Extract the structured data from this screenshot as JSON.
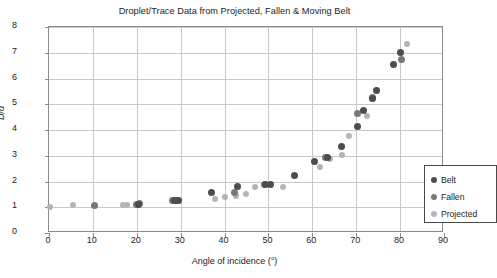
{
  "chart_data": {
    "type": "scatter",
    "title": "Droplet/Trace Data from Projected, Fallen & Moving Belt",
    "xlabel": "Angle of incidence (°)",
    "ylabel": "D/d",
    "xlim": [
      0,
      90
    ],
    "ylim": [
      0,
      8
    ],
    "xticks": [
      0,
      10,
      20,
      30,
      40,
      50,
      60,
      70,
      80,
      90
    ],
    "yticks": [
      0,
      1,
      2,
      3,
      4,
      5,
      6,
      7,
      8
    ],
    "grid": true,
    "legend_position": "right-inside",
    "colors": {
      "belt": "#4d4d4d",
      "fallen": "#787878",
      "projected": "#b4b4b4"
    },
    "series": [
      {
        "name": "Belt",
        "color": "#4d4d4d",
        "points": [
          [
            20.4,
            1.12
          ],
          [
            28.6,
            1.25
          ],
          [
            29.6,
            1.26
          ],
          [
            37.0,
            1.58
          ],
          [
            43.0,
            1.8
          ],
          [
            49.4,
            1.88
          ],
          [
            50.4,
            1.88
          ],
          [
            56.0,
            2.25
          ],
          [
            60.6,
            2.76
          ],
          [
            63.4,
            2.95
          ],
          [
            66.6,
            3.35
          ],
          [
            70.2,
            4.15
          ],
          [
            71.6,
            4.75
          ],
          [
            73.8,
            5.23
          ],
          [
            74.6,
            5.54
          ],
          [
            78.4,
            6.55
          ],
          [
            80.2,
            7.02
          ]
        ]
      },
      {
        "name": "Fallen",
        "color": "#787878",
        "points": [
          [
            10.4,
            1.08
          ],
          [
            20.0,
            1.1
          ],
          [
            20.6,
            1.16
          ],
          [
            28.2,
            1.25
          ],
          [
            29.2,
            1.27
          ],
          [
            42.2,
            1.57
          ],
          [
            49.0,
            1.88
          ],
          [
            63.0,
            2.92
          ],
          [
            70.2,
            4.64
          ],
          [
            73.6,
            5.28
          ],
          [
            80.4,
            6.72
          ]
        ]
      },
      {
        "name": "Projected",
        "color": "#b4b4b4",
        "points": [
          [
            0.2,
            1.02
          ],
          [
            5.4,
            1.1
          ],
          [
            16.8,
            1.08
          ],
          [
            17.8,
            1.08
          ],
          [
            20.0,
            1.08
          ],
          [
            37.8,
            1.32
          ],
          [
            40.2,
            1.4
          ],
          [
            42.6,
            1.45
          ],
          [
            44.8,
            1.52
          ],
          [
            47.0,
            1.78
          ],
          [
            53.4,
            1.8
          ],
          [
            61.8,
            2.58
          ],
          [
            64.0,
            2.86
          ],
          [
            66.8,
            3.04
          ],
          [
            68.4,
            3.76
          ],
          [
            72.4,
            4.55
          ],
          [
            81.6,
            7.35
          ]
        ]
      }
    ]
  },
  "legend": {
    "items": [
      {
        "label": "Belt",
        "key": "belt"
      },
      {
        "label": "Fallen",
        "key": "fallen"
      },
      {
        "label": "Projected",
        "key": "projected"
      }
    ]
  }
}
